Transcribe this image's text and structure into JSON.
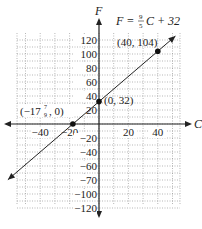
{
  "chart_data": {
    "type": "line",
    "title": "",
    "equation": "F = 9/5 C + 32",
    "equation_parts": {
      "lhs": "F =",
      "num": "9",
      "den": "5",
      "rhs": "C + 32"
    },
    "xlabel": "C",
    "ylabel": "F",
    "x_ticks": [
      -40,
      -20,
      20,
      40
    ],
    "x_tick_labels": [
      "−40",
      "−20",
      "20",
      "40"
    ],
    "y_ticks": [
      120,
      100,
      80,
      60,
      40,
      20,
      -20,
      -40,
      -60,
      -80,
      -100,
      -120
    ],
    "y_tick_labels": [
      "120",
      "100",
      "80",
      "60",
      "40",
      "20",
      "−20",
      "−40",
      "−60",
      "−70",
      "−100",
      "−120"
    ],
    "xlim": [
      -55,
      55
    ],
    "ylim": [
      -125,
      125
    ],
    "grid": true,
    "series": [
      {
        "name": "F = 9/5 C + 32",
        "x": [
          -60,
          60
        ],
        "y": [
          -76,
          140
        ]
      }
    ],
    "points": [
      {
        "x": 40,
        "y": 104,
        "label": "(40, 104)"
      },
      {
        "x": 0,
        "y": 32,
        "label": "(0, 32)"
      },
      {
        "x": -17.78,
        "y": 0,
        "label_a": "(−17",
        "label_num": "7",
        "label_den": "9",
        "label_b": ", 0)"
      }
    ]
  }
}
